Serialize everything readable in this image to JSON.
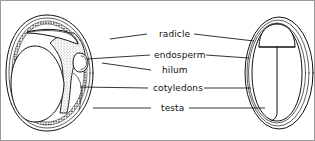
{
  "figure": {
    "background_color": "#ffffff",
    "ink_color": "#111111",
    "border_color": "#9a9a9a"
  },
  "labels": [
    {
      "id": "radicle",
      "text": "radicle",
      "x": 158,
      "y": 33,
      "left_leader": {
        "x1": 146,
        "y1": 33,
        "x2": 109,
        "y2": 38
      },
      "right_leader": {
        "x1": 193,
        "y1": 33,
        "x2": 253,
        "y2": 40
      }
    },
    {
      "id": "endosperm",
      "text": "endosperm",
      "x": 153,
      "y": 54,
      "left_leader": {
        "x1": 149,
        "y1": 54,
        "x2": 85,
        "y2": 58
      },
      "right_leader": {
        "x1": 204,
        "y1": 54,
        "x2": 248,
        "y2": 56
      }
    },
    {
      "id": "hilum",
      "text": "hilum",
      "x": 161,
      "y": 69,
      "left_leader": {
        "x1": 150,
        "y1": 69,
        "x2": 100,
        "y2": 62
      },
      "right_leader": null
    },
    {
      "id": "cotyledons",
      "text": "cotyledons",
      "x": 152,
      "y": 87,
      "left_leader": {
        "x1": 147,
        "y1": 87,
        "x2": 78,
        "y2": 86
      },
      "right_leader": {
        "x1": 202,
        "y1": 87,
        "x2": 250,
        "y2": 87
      }
    },
    {
      "id": "testa",
      "text": "testa",
      "x": 160,
      "y": 107,
      "left_leader": {
        "x1": 150,
        "y1": 107,
        "x2": 92,
        "y2": 107
      },
      "right_leader": {
        "x1": 188,
        "y1": 107,
        "x2": 265,
        "y2": 107
      }
    }
  ],
  "left_seed": {
    "name": "seed-longitudinal-section",
    "parts": [
      "testa",
      "endosperm",
      "cotyledons",
      "radicle",
      "hilum"
    ]
  },
  "right_seed": {
    "name": "seed-external-view",
    "parts": [
      "testa",
      "radicle",
      "cotyledons"
    ]
  }
}
